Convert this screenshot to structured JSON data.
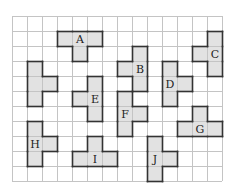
{
  "grid": {
    "origin_x": 12,
    "origin_y": 16,
    "cell_size": 15,
    "columns": 14,
    "rows": 11,
    "line_color": "#c4c4c4"
  },
  "style": {
    "fill_color": "#e2e2e2",
    "border_color": "#333333"
  },
  "pieces": [
    {
      "label": "A",
      "cells": [
        [
          3,
          1
        ],
        [
          4,
          1
        ],
        [
          5,
          1
        ],
        [
          4,
          2
        ]
      ],
      "label_cell": [
        4,
        1
      ]
    },
    {
      "label": "B",
      "cells": [
        [
          8,
          2
        ],
        [
          8,
          3
        ],
        [
          8,
          4
        ],
        [
          7,
          3
        ]
      ],
      "label_cell": [
        8,
        3
      ]
    },
    {
      "label": "C",
      "cells": [
        [
          13,
          1
        ],
        [
          13,
          2
        ],
        [
          13,
          3
        ],
        [
          12,
          2
        ]
      ],
      "label_cell": [
        13,
        2
      ]
    },
    {
      "label": "D",
      "cells": [
        [
          10,
          3
        ],
        [
          10,
          4
        ],
        [
          10,
          5
        ],
        [
          11,
          4
        ]
      ],
      "label_cell": [
        10,
        4
      ]
    },
    {
      "label": "E",
      "cells": [
        [
          5,
          4
        ],
        [
          5,
          5
        ],
        [
          5,
          6
        ],
        [
          4,
          5
        ]
      ],
      "label_cell": [
        5,
        5
      ]
    },
    {
      "label": "F",
      "cells": [
        [
          7,
          5
        ],
        [
          7,
          6
        ],
        [
          7,
          7
        ],
        [
          8,
          6
        ]
      ],
      "label_cell": [
        7,
        6
      ]
    },
    {
      "label": "G",
      "cells": [
        [
          11,
          7
        ],
        [
          12,
          7
        ],
        [
          13,
          7
        ],
        [
          12,
          6
        ]
      ],
      "label_cell": [
        12,
        7
      ]
    },
    {
      "label": "H",
      "cells": [
        [
          1,
          7
        ],
        [
          1,
          8
        ],
        [
          1,
          9
        ],
        [
          2,
          8
        ]
      ],
      "label_cell": [
        1,
        8
      ]
    },
    {
      "label": "I",
      "cells": [
        [
          4,
          9
        ],
        [
          5,
          9
        ],
        [
          6,
          9
        ],
        [
          5,
          8
        ]
      ],
      "label_cell": [
        5,
        9
      ]
    },
    {
      "label": "J",
      "cells": [
        [
          9,
          8
        ],
        [
          9,
          9
        ],
        [
          9,
          10
        ],
        [
          10,
          9
        ]
      ],
      "label_cell": [
        9,
        9
      ]
    },
    {
      "label": "",
      "cells": [
        [
          1,
          3
        ],
        [
          1,
          4
        ],
        [
          1,
          5
        ],
        [
          2,
          4
        ]
      ],
      "label_cell": null
    }
  ]
}
